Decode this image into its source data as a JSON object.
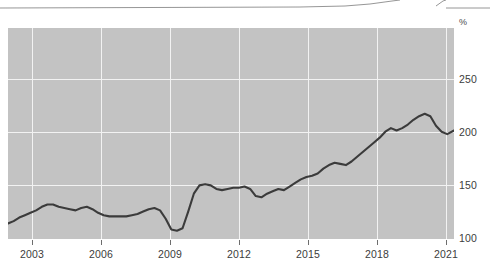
{
  "chart_data": {
    "type": "line",
    "title": "",
    "subtitle": "",
    "xlabel": "",
    "ylabel": "%",
    "unit_label": "%",
    "grid": true,
    "legend_position": "none",
    "xlim": [
      2002.0,
      2021.8
    ],
    "ylim": [
      95,
      272
    ],
    "xticks": [
      "2003",
      "2006",
      "2009",
      "2012",
      "2015",
      "2018",
      "2021"
    ],
    "xtick_values": [
      2003,
      2006,
      2009,
      2012,
      2015,
      2018,
      2021
    ],
    "yticks": [
      "100",
      "150",
      "200",
      "250"
    ],
    "ytick_values": [
      100,
      150,
      200,
      250
    ],
    "series": [
      {
        "name": "Index",
        "color": "#3b3b3b",
        "x": [
          2002.0,
          2002.25,
          2002.5,
          2002.75,
          2003.0,
          2003.25,
          2003.5,
          2003.75,
          2004.0,
          2004.25,
          2004.5,
          2004.75,
          2005.0,
          2005.25,
          2005.5,
          2005.75,
          2006.0,
          2006.25,
          2006.5,
          2006.75,
          2007.0,
          2007.25,
          2007.5,
          2007.75,
          2008.0,
          2008.25,
          2008.5,
          2008.75,
          2009.0,
          2009.25,
          2009.5,
          2009.75,
          2010.0,
          2010.25,
          2010.5,
          2010.75,
          2011.0,
          2011.25,
          2011.5,
          2011.75,
          2012.0,
          2012.25,
          2012.5,
          2012.75,
          2013.0,
          2013.25,
          2013.5,
          2013.75,
          2014.0,
          2014.25,
          2014.5,
          2014.75,
          2015.0,
          2015.25,
          2015.5,
          2015.75,
          2016.0,
          2016.25,
          2016.5,
          2016.75,
          2017.0,
          2017.25,
          2017.5,
          2017.75,
          2018.0,
          2018.25,
          2018.5,
          2018.75,
          2019.0,
          2019.25,
          2019.5,
          2019.75,
          2020.0,
          2020.25,
          2020.5,
          2020.75,
          2021.0,
          2021.25,
          2021.5,
          2021.8
        ],
        "values": [
          108,
          110,
          113,
          115,
          117,
          119,
          122,
          124,
          124,
          122,
          121,
          120,
          119,
          121,
          122,
          120,
          117,
          115,
          114,
          114,
          114,
          114,
          115,
          116,
          118,
          120,
          121,
          119,
          112,
          103,
          102,
          104,
          118,
          133,
          140,
          141,
          140,
          137,
          136,
          137,
          138,
          138,
          139,
          137,
          131,
          130,
          133,
          135,
          137,
          136,
          139,
          142,
          145,
          147,
          148,
          150,
          154,
          157,
          159,
          158,
          157,
          160,
          164,
          168,
          172,
          176,
          180,
          185,
          188,
          186,
          188,
          191,
          195,
          198,
          200,
          198,
          190,
          185,
          183,
          186
        ]
      }
    ],
    "annotations": [
      {
        "label": "2009 trough",
        "x": 2009.4,
        "y": 102
      },
      {
        "label": "2018 local peak",
        "x": 2018.15,
        "y": 200
      },
      {
        "label": "2019 dip",
        "x": 2018.75,
        "y": 184
      },
      {
        "label": "2021 peak",
        "x": 2021.15,
        "y": 238
      },
      {
        "label": "series end",
        "x": 2021.8,
        "y": 231
      }
    ]
  },
  "axes": {
    "unit": "%"
  }
}
